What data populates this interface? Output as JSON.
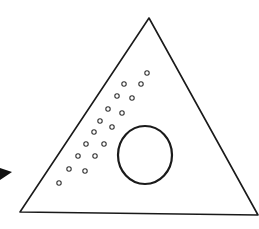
{
  "figure": {
    "colors": {
      "stroke": "#1a1a1a",
      "background": "#ffffff",
      "arrow": "#111111"
    },
    "triangle": {
      "apex": [
        149,
        18
      ],
      "base_left": [
        20,
        212
      ],
      "base_right": [
        258,
        215
      ]
    },
    "large_circle": {
      "cx": 145,
      "cy": 155,
      "rx": 27,
      "ry": 29
    },
    "small_circles": [
      [
        147,
        73
      ],
      [
        124,
        84
      ],
      [
        141,
        84
      ],
      [
        117,
        96
      ],
      [
        132,
        98
      ],
      [
        108,
        109
      ],
      [
        122,
        113
      ],
      [
        100,
        121
      ],
      [
        112,
        127
      ],
      [
        94,
        132
      ],
      [
        86,
        144
      ],
      [
        104,
        144
      ],
      [
        78,
        156
      ],
      [
        95,
        156
      ],
      [
        69,
        169
      ],
      [
        85,
        171
      ],
      [
        59,
        183
      ]
    ],
    "arrow_tip": {
      "points": [
        [
          0,
          168
        ],
        [
          12,
          172
        ],
        [
          0,
          180
        ]
      ]
    }
  }
}
